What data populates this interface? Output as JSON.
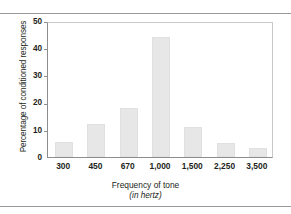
{
  "chart_data": {
    "type": "bar",
    "title": "",
    "subtitle": "",
    "xlabel": "Frequency of tone",
    "xlabel_sub": "(in hertz)",
    "ylabel": "Percentage of conditioned responses",
    "categories": [
      "300",
      "450",
      "670",
      "1,000",
      "1,500",
      "2,250",
      "3,500"
    ],
    "values": [
      5.5,
      12.3,
      18,
      44,
      11,
      5,
      3.3
    ],
    "ylim": [
      0,
      50
    ],
    "yticks": [
      0,
      10,
      20,
      30,
      40,
      50
    ],
    "ytick_labels": [
      "0",
      "10",
      "20",
      "30",
      "40",
      "50"
    ],
    "grid": false,
    "legend": null,
    "bar_color": "#e7e7e7",
    "axis_color": "#8d8d8d",
    "frame_color": "#c9c9c9",
    "text_color": "#231f20"
  }
}
